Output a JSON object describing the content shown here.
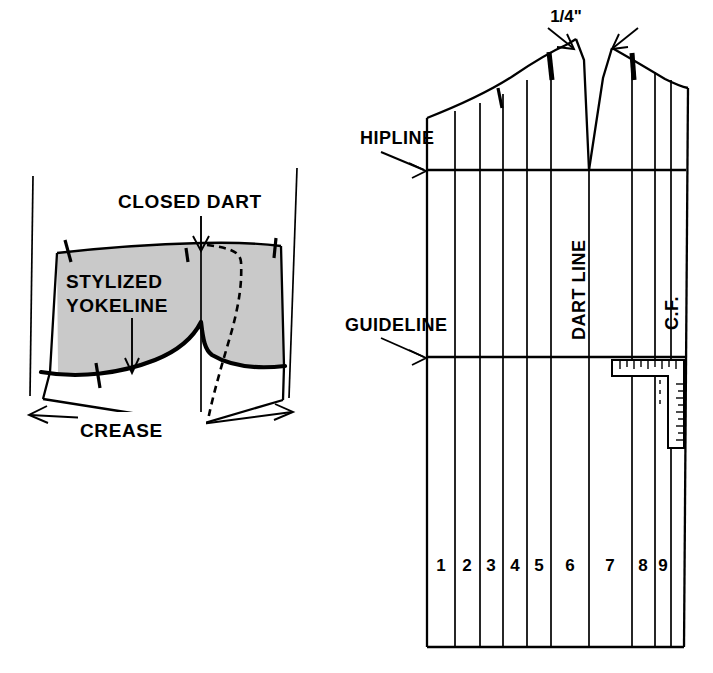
{
  "figure": {
    "type": "technical-line-drawing"
  },
  "left_diagram": {
    "name": "stylized-yokeline-panel",
    "labels": {
      "closed_dart": "CLOSED DART",
      "stylized_yokeline_line1": "STYLIZED",
      "stylized_yokeline_line2": "YOKELINE",
      "crease": "CREASE"
    },
    "annotations": {
      "shaded_region_name": "yoke-area",
      "shaded_region_color": "#c9c9c9",
      "dashed_line_name": "original-dart-leg",
      "crease_arrow_direction": "double-headed-horizontal"
    }
  },
  "right_diagram": {
    "name": "skirt-front-draft-panel",
    "labels": {
      "quarter_inch": "1/4\"",
      "hipline": "HIPLINE",
      "guideline": "GUIDELINE",
      "dart_line": "DART LINE",
      "center_front": "C.F."
    },
    "section_numbers": [
      "1",
      "2",
      "3",
      "4",
      "5",
      "6",
      "7",
      "8",
      "9"
    ],
    "annotations": {
      "ruler_name": "tailors-square-ruler",
      "dart_notch_name": "dart-v-notch",
      "arrow_count_at_top": 2,
      "vertical_slash_lines": 10
    }
  },
  "colors": {
    "ink": "#000000",
    "paper": "#ffffff",
    "shade": "#c9c9c9"
  }
}
